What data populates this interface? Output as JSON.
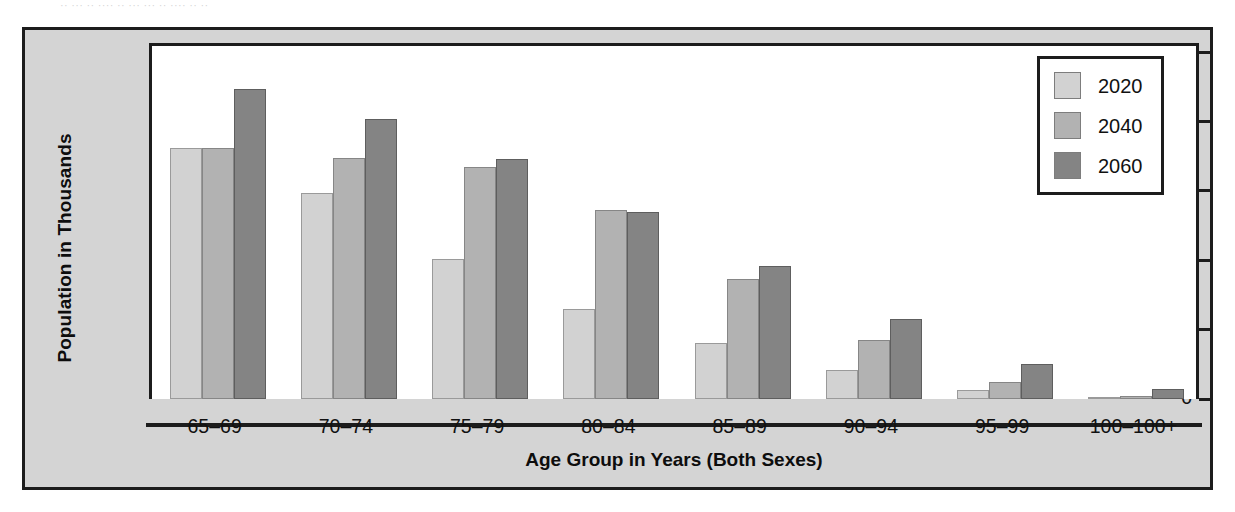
{
  "figure": {
    "background_color": "#d4d4d4",
    "plot_background_color": "#ffffff",
    "border_color": "#1c1c1c",
    "scan_artifact_text": "·· ··· ·· ···· ·· ···  ··· ·· ···· ·· ··"
  },
  "chart_data": {
    "type": "bar",
    "title": "",
    "xlabel": "Age Group in Years (Both Sexes)",
    "ylabel": "Population in Thousands",
    "categories": [
      "65–69",
      "70–74",
      "75–79",
      "80–84",
      "85–89",
      "90–94",
      "95–99",
      "100–100+"
    ],
    "series": [
      {
        "name": "2020",
        "color": "#d2d2d2",
        "values": [
          18100,
          14850,
          10100,
          6500,
          4050,
          2100,
          650,
          100
        ]
      },
      {
        "name": "2040",
        "color": "#b2b2b2",
        "values": [
          18100,
          17400,
          16750,
          13600,
          8650,
          4250,
          1250,
          250
        ]
      },
      {
        "name": "2060",
        "color": "#848484",
        "values": [
          22350,
          20200,
          17300,
          13450,
          9600,
          5750,
          2550,
          750
        ]
      }
    ],
    "ylim": [
      0,
      25000
    ],
    "ytick_values": [
      0,
      5000,
      10000,
      15000,
      20000,
      25000
    ],
    "ytick_labels": [
      "0",
      "5,000",
      "10,000",
      "15,000",
      "20,000",
      "25,000"
    ],
    "grid": false,
    "legend_position": "top-right",
    "legend_entries": [
      "2020",
      "2040",
      "2060"
    ]
  }
}
